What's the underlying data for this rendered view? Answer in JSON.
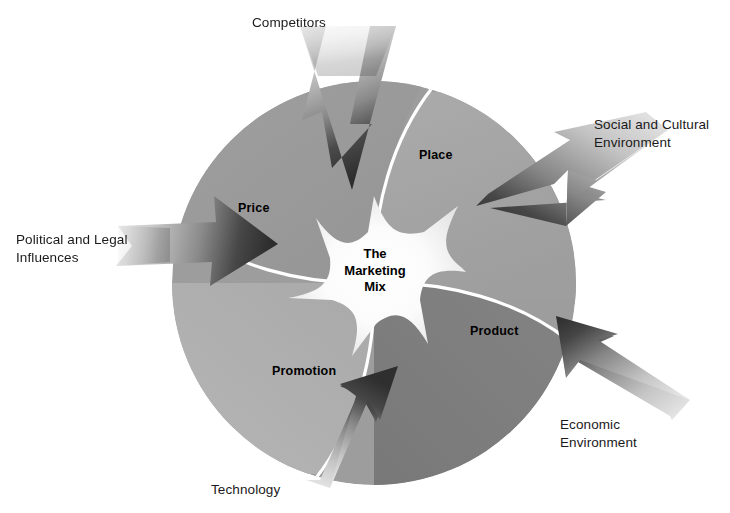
{
  "diagram": {
    "title": "The Marketing Mix",
    "center_label": "The\nMarketing\nMix",
    "quadrants": [
      {
        "id": "price",
        "label": "Price",
        "color": "#9a9a9a"
      },
      {
        "id": "place",
        "label": "Place",
        "color": "#a5a5a5"
      },
      {
        "id": "product",
        "label": "Product",
        "color": "#808080"
      },
      {
        "id": "promotion",
        "label": "Promotion",
        "color": "#b0b0b0"
      }
    ],
    "external_factors": [
      {
        "id": "competitors",
        "label": "Competitors",
        "direction": "down"
      },
      {
        "id": "social",
        "label": "Social and Cultural\nEnvironment",
        "direction": "down-left"
      },
      {
        "id": "economic",
        "label": "Economic\nEnvironment",
        "direction": "up-left"
      },
      {
        "id": "technology",
        "label": "Technology",
        "direction": "up"
      },
      {
        "id": "political",
        "label": "Political and Legal\nInfluences",
        "direction": "right"
      }
    ],
    "colors": {
      "background": "#ffffff",
      "divider": "#ffffff",
      "starburst": "#f2f2f2",
      "arrow_dark": "#3a3a3a",
      "arrow_light": "#d8d8d8",
      "text": "#000000"
    }
  }
}
